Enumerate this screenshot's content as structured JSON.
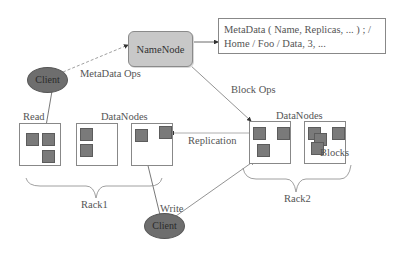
{
  "diagram": {
    "type": "HDFS architecture",
    "namenode": {
      "label": "NameNode",
      "fill": "#c8c8c8"
    },
    "metadata_box": {
      "line1": "MetaData ( Name, Replicas, ... ) ; /",
      "line2": "Home / Foo / Data, 3, ..."
    },
    "clients": [
      {
        "id": "client-top",
        "label": "Client",
        "fill": "#6e6e6e"
      },
      {
        "id": "client-bottom",
        "label": "Client",
        "fill": "#6e6e6e"
      }
    ],
    "edges": {
      "metadata_ops": "MetaData Ops",
      "block_ops": "Block Ops",
      "read": "Read",
      "write": "Write",
      "replication": "Replication"
    },
    "racks": [
      {
        "label": "Rack1",
        "datanodes_label": "DataNodes",
        "datanode_count": 3
      },
      {
        "label": "Rack2",
        "datanodes_label": "DataNodes",
        "datanode_count": 2
      }
    ],
    "blocks_label": "Blocks",
    "block_color": "#7a7a7a"
  }
}
